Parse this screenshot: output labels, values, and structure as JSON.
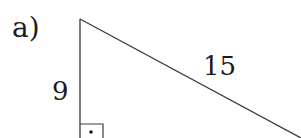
{
  "problem": {
    "label": "a)"
  },
  "triangle": {
    "type": "right-triangle",
    "vertices": {
      "top": [
        80,
        19
      ],
      "right_angle": [
        80,
        138
      ],
      "bottom_right": [
        301,
        138
      ]
    },
    "sides": {
      "vertical_leg": "9",
      "hypotenuse": "15"
    },
    "right_angle_marker": {
      "x": 81,
      "y": 124,
      "size": 22,
      "dot": [
        91,
        133
      ]
    },
    "stroke_color": "#3a3a3a"
  }
}
